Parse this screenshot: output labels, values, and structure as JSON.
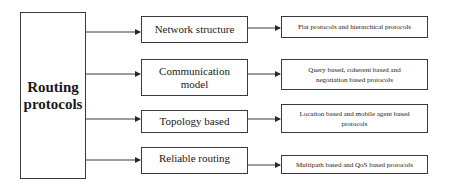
{
  "diagram": {
    "root": {
      "label_line1": "Routing",
      "label_line2": "protocols"
    },
    "categories": [
      {
        "label": "Network structure",
        "leaf": "Flat protocols and hierarchical protocols"
      },
      {
        "label": "Communication model",
        "leaf": "Query based, coherent based and negotiation based protocols"
      },
      {
        "label": "Topology based",
        "leaf": "Location based and  mobile agent based protocols"
      },
      {
        "label": "Reliable routing",
        "leaf": "Multipath based and QoS based protocols"
      }
    ],
    "colors": {
      "line": "#3a3a3a",
      "background": "#ffffff",
      "text": "#1a1a1a"
    }
  }
}
